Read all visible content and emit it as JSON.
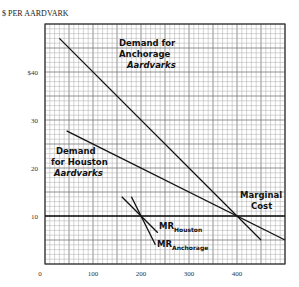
{
  "chart_data": {
    "type": "line",
    "title": "",
    "ylabel": "$ PER AARDVARK",
    "xlabel": "",
    "xlim": [
      0,
      500
    ],
    "ylim": [
      0,
      50
    ],
    "grid": true,
    "x_ticks": [
      0,
      100,
      200,
      300,
      400
    ],
    "x_tick_labels": [
      "0",
      "100",
      "200",
      "300",
      "400"
    ],
    "y_ticks": [
      10,
      20,
      30,
      40
    ],
    "y_tick_labels": [
      "10",
      "20",
      "30",
      "$40"
    ],
    "series": [
      {
        "name": "Demand for Anchorage Aardvarks",
        "x": [
          30,
          450
        ],
        "y": [
          47,
          5
        ]
      },
      {
        "name": "Demand for Houston Aardvarks",
        "x": [
          45,
          500
        ],
        "y": [
          27.75,
          5
        ]
      },
      {
        "name": "MR Houston",
        "x": [
          160,
          235
        ],
        "y": [
          14,
          6.5
        ]
      },
      {
        "name": "MR Anchorage",
        "x": [
          180,
          230
        ],
        "y": [
          14,
          4
        ]
      },
      {
        "name": "Marginal Cost",
        "x": [
          0,
          500
        ],
        "y": [
          10,
          10
        ]
      }
    ],
    "annotations": [
      {
        "text": "Demand for Anchorage Aardvarks",
        "near": [
          180,
          45
        ]
      },
      {
        "text": "Demand for Houston Aardvarks",
        "near": [
          60,
          22
        ]
      },
      {
        "text": "Marginal Cost",
        "near": [
          440,
          13
        ]
      },
      {
        "text": "MR Houston",
        "near": [
          245,
          8
        ]
      },
      {
        "text": "MR Anchorage",
        "near": [
          250,
          3
        ]
      }
    ]
  },
  "labels": {
    "y_title": "$ PER AARDVARK",
    "demand_anchorage": [
      "Demand for",
      "Anchorage",
      "Aardvarks"
    ],
    "demand_houston": [
      "Demand",
      "for Houston",
      "Aardvarks"
    ],
    "marginal_cost": [
      "Marginal",
      "Cost"
    ],
    "mr_houston": {
      "main": "MR",
      "sub": "Houston"
    },
    "mr_anchorage": {
      "main": "MR",
      "sub": "Anchorage"
    }
  }
}
